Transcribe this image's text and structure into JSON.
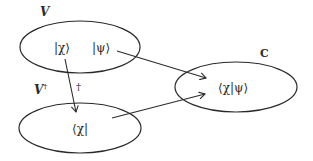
{
  "diagram": {
    "sets": [
      {
        "id": "V",
        "label": "V",
        "elements": [
          "|χ⟩",
          "|ψ⟩"
        ]
      },
      {
        "id": "V-dagger",
        "label": "V",
        "label_sup": "†",
        "elements": [
          "⟨χ|"
        ]
      },
      {
        "id": "C",
        "label": "C",
        "elements": [
          "⟨χ|ψ⟩"
        ]
      }
    ],
    "arrows": [
      {
        "from": "|χ⟩",
        "to": "⟨χ|",
        "label": "†"
      },
      {
        "from": "|ψ⟩",
        "to": "⟨χ|ψ⟩",
        "label": ""
      },
      {
        "from": "⟨χ|",
        "to": "⟨χ|ψ⟩",
        "label": ""
      }
    ],
    "labels": {
      "set_v": "V",
      "set_vdag": "V",
      "set_vdag_sup": "†",
      "set_c": "C",
      "ket_chi": "|χ⟩",
      "ket_psi": "|ψ⟩",
      "bra_chi": "⟨χ|",
      "inner_product": "⟨χ|ψ⟩",
      "dagger_arrow": "†"
    },
    "colors": {
      "stroke": "#2a2a2a",
      "text": "#2a2a2a",
      "background": "#ffffff"
    }
  }
}
